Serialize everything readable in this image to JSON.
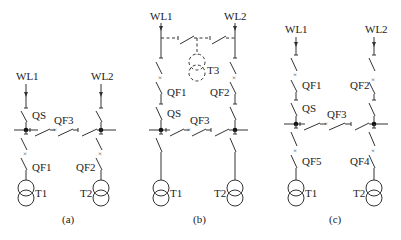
{
  "diagrams": [
    {
      "id": "a",
      "caption": "(a)",
      "labels": {
        "wl1": "WL1",
        "wl2": "WL2",
        "qs": "QS",
        "qf3": "QF3",
        "qf1": "QF1",
        "qf2": "QF2",
        "t1": "T1",
        "t2": "T2"
      }
    },
    {
      "id": "b",
      "caption": "(b)",
      "labels": {
        "wl1": "WL1",
        "wl2": "WL2",
        "t3": "T3",
        "qf1": "QF1",
        "qf2": "QF2",
        "qs": "QS",
        "qf3": "QF3",
        "t1": "T1",
        "t2": "T2"
      }
    },
    {
      "id": "c",
      "caption": "(c)",
      "labels": {
        "wl1": "WL1",
        "wl2": "WL2",
        "qf1": "QF1",
        "qf2": "QF2",
        "qs": "QS",
        "qf3": "QF3",
        "qf5": "QF5",
        "qf4": "QF4",
        "t1": "T1",
        "t2": "T2"
      }
    }
  ],
  "colors": {
    "line": "#333333",
    "text": "#222222",
    "background": "#ffffff"
  }
}
